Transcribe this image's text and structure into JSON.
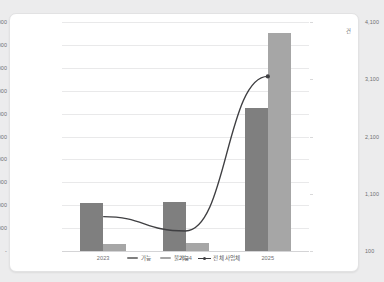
{
  "chart_data": {
    "type": "bar",
    "title": "",
    "xlabel": "",
    "ylabel": "",
    "categories": [
      "2023",
      "2024",
      "2025"
    ],
    "series": [
      {
        "name": "가능",
        "axis": "left",
        "color": "#7f7f7f",
        "type": "bar",
        "values": [
          420000,
          430000,
          1250000
        ]
      },
      {
        "name": "불가능",
        "axis": "left",
        "color": "#a6a6a6",
        "type": "bar",
        "values": [
          65000,
          68000,
          1900000
        ]
      },
      {
        "name": "전체 사업체",
        "axis": "right",
        "color": "#3f3f42",
        "type": "line",
        "values": [
          700,
          450,
          3150
        ]
      }
    ],
    "left_axis": {
      "ticks": [
        "-",
        "200,000",
        "400,000",
        "600,000",
        "800,000",
        "1,000,000",
        "1,200,000",
        "1,400,000",
        "1,600,000",
        "1,800,000",
        "2,000,000"
      ],
      "values": [
        0,
        200000,
        400000,
        600000,
        800000,
        1000000,
        1200000,
        1400000,
        1600000,
        1800000,
        2000000
      ],
      "ylim": [
        0,
        2000000
      ]
    },
    "right_axis": {
      "ticks": [
        "100",
        "1,100",
        "2,100",
        "3,100",
        "4,100"
      ],
      "values": [
        100,
        1100,
        2100,
        3100,
        4100
      ],
      "ylim": [
        100,
        4100
      ],
      "unit": "건"
    },
    "grid": true,
    "legend_position": "bottom"
  },
  "legend": {
    "items": [
      {
        "label": "가능"
      },
      {
        "label": "불가능"
      },
      {
        "label": "전체 사업체"
      }
    ]
  }
}
